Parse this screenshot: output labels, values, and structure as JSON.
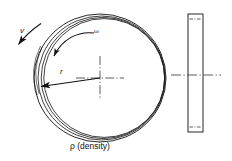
{
  "figure": {
    "type": "engineering-diagram",
    "caption": "ρ (density)",
    "background_color": "#ffffff",
    "line_color": "#111111"
  },
  "labels": {
    "velocity": "v",
    "angular_velocity": "ω",
    "radius": "r",
    "density": "ρ (density)"
  },
  "front_view": {
    "name": "ring-front-view",
    "center": {
      "x": 100,
      "y": 78
    },
    "outer_radius_x": 66,
    "outer_radius_y": 64,
    "ring_line_count": 4,
    "ring_band_offsets": [
      0,
      3,
      5.5,
      7.5
    ],
    "centerline_style": "dash-dot",
    "centerline_half_length_x": 24,
    "centerline_half_length_y": 22
  },
  "side_view": {
    "name": "ring-side-view",
    "left": 188,
    "top": 14,
    "width": 15,
    "height": 118,
    "centerline_style": "dash-dot",
    "centerline_y": 75,
    "centerline_left": 171,
    "centerline_right": 221,
    "top_dash_y": 19,
    "bottom_dash_y": 127
  },
  "vectors": {
    "velocity_arrow": {
      "name": "velocity-vector-arrow",
      "from": {
        "x": 40,
        "y": 24
      },
      "to": {
        "x": 14,
        "y": 48
      },
      "tangential": true
    },
    "omega_arc": {
      "name": "angular-velocity-arc",
      "start": {
        "x": 96,
        "y": 33
      },
      "end": {
        "x": 53,
        "y": 62
      },
      "direction": "counter-clockwise"
    },
    "radius_arrow": {
      "name": "radius-arrow",
      "from": {
        "x": 100,
        "y": 78
      },
      "to": {
        "x": 37,
        "y": 87
      }
    }
  }
}
